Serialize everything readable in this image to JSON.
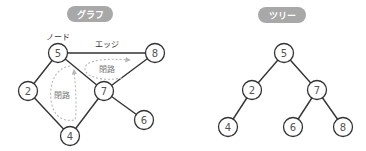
{
  "graph": {
    "title": "グラフ",
    "labels": {
      "node": "ノード",
      "edge": "エッジ",
      "cycle_top": "閉路",
      "cycle_left": "閉路"
    },
    "nodes": [
      {
        "id": "5",
        "label": "5",
        "x": 58,
        "y": 53
      },
      {
        "id": "8",
        "label": "8",
        "x": 155,
        "y": 53
      },
      {
        "id": "2",
        "label": "2",
        "x": 28,
        "y": 91
      },
      {
        "id": "7",
        "label": "7",
        "x": 104,
        "y": 91
      },
      {
        "id": "4",
        "label": "4",
        "x": 70,
        "y": 136
      },
      {
        "id": "6",
        "label": "6",
        "x": 144,
        "y": 120
      }
    ],
    "edges": [
      [
        "5",
        "8"
      ],
      [
        "5",
        "2"
      ],
      [
        "5",
        "7"
      ],
      [
        "7",
        "8"
      ],
      [
        "2",
        "4"
      ],
      [
        "4",
        "7"
      ],
      [
        "7",
        "6"
      ]
    ]
  },
  "tree": {
    "title": "ツリー",
    "nodes": [
      {
        "id": "5",
        "label": "5",
        "x": 284,
        "y": 53
      },
      {
        "id": "2",
        "label": "2",
        "x": 252,
        "y": 90
      },
      {
        "id": "7",
        "label": "7",
        "x": 317,
        "y": 90
      },
      {
        "id": "4",
        "label": "4",
        "x": 228,
        "y": 127
      },
      {
        "id": "6",
        "label": "6",
        "x": 293,
        "y": 127
      },
      {
        "id": "8",
        "label": "8",
        "x": 343,
        "y": 127
      }
    ],
    "edges": [
      [
        "5",
        "2"
      ],
      [
        "5",
        "7"
      ],
      [
        "2",
        "4"
      ],
      [
        "7",
        "6"
      ],
      [
        "7",
        "8"
      ]
    ]
  },
  "colors": {
    "pill": "#a8a8a8",
    "stroke": "#333333",
    "node_text": "#555555",
    "cycle": "#b8b8b8"
  }
}
